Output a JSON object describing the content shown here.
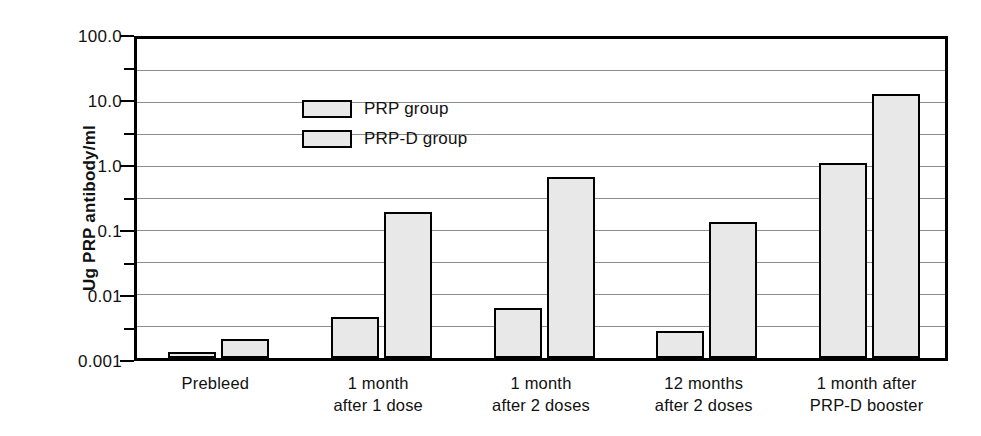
{
  "chart_data": {
    "type": "bar",
    "title": "",
    "xlabel": "",
    "ylabel": "Ug PRP antibody/ml",
    "yscale": "log",
    "ylim": [
      0.001,
      100.0
    ],
    "ytick_labels": [
      "100.0",
      "10.0",
      "1.0",
      "0.1",
      "0.01",
      "0.001"
    ],
    "ytick_values": [
      100.0,
      10.0,
      1.0,
      0.1,
      0.01,
      0.001
    ],
    "grid": true,
    "legend_position": "upper-left-inside",
    "categories": [
      "Prebleed",
      "1 month after 1 dose",
      "1 month after 2 doses",
      "12 months after 2 doses",
      "1 month after PRP-D booster"
    ],
    "category_lines": [
      [
        "Prebleed",
        ""
      ],
      [
        "1 month",
        "after 1 dose"
      ],
      [
        "1 month",
        "after 2 doses"
      ],
      [
        "12 months",
        "after 2 doses"
      ],
      [
        "1 month after",
        "PRP-D booster"
      ]
    ],
    "series": [
      {
        "name": "PRP group",
        "values": [
          0.0012,
          0.0043,
          0.0058,
          0.0026,
          1.1
        ]
      },
      {
        "name": "PRP-D group",
        "values": [
          0.0019,
          0.19,
          0.67,
          0.13,
          13.5
        ]
      }
    ],
    "colors": {
      "bar_fill": "#e8e8e8",
      "bar_edge": "#000000",
      "gridline": "#8d8d8d",
      "axis": "#000000",
      "background": "#ffffff",
      "text": "#111111"
    }
  },
  "legend": {
    "items": [
      {
        "label": "PRP group"
      },
      {
        "label": "PRP-D group"
      }
    ]
  }
}
